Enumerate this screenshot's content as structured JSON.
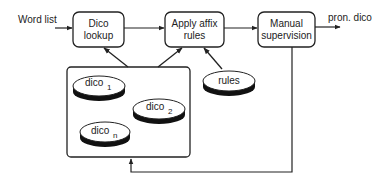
{
  "diagram": {
    "input_label": "Word list",
    "output_label": "pron. dico",
    "boxes": {
      "dico_lookup": {
        "line1": "Dico",
        "line2": "lookup"
      },
      "apply_affix": {
        "line1": "Apply affix",
        "line2": "rules"
      },
      "manual_supervision": {
        "line1": "Manual",
        "line2": "supervision"
      }
    },
    "dictionaries": [
      {
        "label": "dico",
        "subscript": "1"
      },
      {
        "label": "dico",
        "subscript": "2"
      },
      {
        "label": "dico",
        "subscript": "n"
      }
    ],
    "rules_store": {
      "label": "rules"
    },
    "colors": {
      "stroke": "#222222",
      "background": "#ffffff",
      "disk_fill": "#111111"
    }
  }
}
